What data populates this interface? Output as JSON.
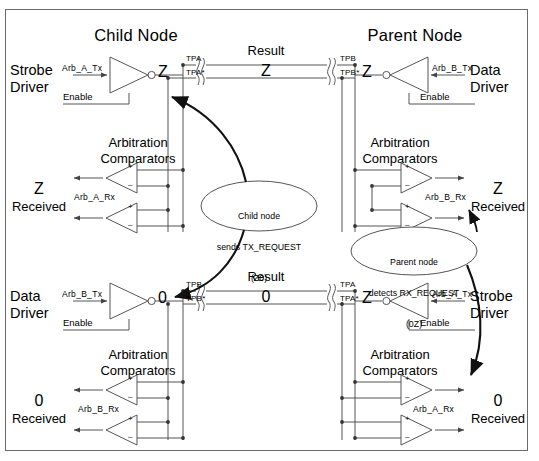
{
  "diagram": {
    "title_child": "Child Node",
    "title_parent": "Parent Node",
    "labels": {
      "strobe_driver_1": "Strobe",
      "strobe_driver_2": "Driver",
      "data_driver_1": "Data",
      "data_driver_2": "Driver",
      "arbitration_1": "Arbitration",
      "arbitration_2": "Comparators",
      "enable": "Enable",
      "result": "Result",
      "received": "Received"
    },
    "signals": {
      "arb_a_tx": "Arb_A_Tx",
      "arb_b_tx": "Arb_B_Tx",
      "arb_a_rx": "Arb_A_Rx",
      "arb_b_rx": "Arb_B_Rx"
    },
    "bus_labels": {
      "tpa": "TPA",
      "tpa_star": "TPA*",
      "tpb": "TPB",
      "tpb_star": "TPB*"
    },
    "top_bus": {
      "left_pair_top": "TPA",
      "left_pair_bottom": "TPA*",
      "right_pair_top": "TPB",
      "right_pair_bottom": "TPB*",
      "result_label": "Result",
      "result_value": "Z"
    },
    "bottom_bus": {
      "left_pair_top": "TPB",
      "left_pair_bottom": "TPB*",
      "right_pair_top": "TPA",
      "right_pair_bottom": "TPA*",
      "result_label": "Result",
      "result_value": "0"
    },
    "levels": {
      "child_strobe_out": "Z",
      "parent_data_out": "Z",
      "child_data_out": "0",
      "parent_strobe_out": "Z",
      "child_top_received": "Z",
      "parent_top_received": "Z",
      "child_bottom_received": "0",
      "parent_bottom_received": "0"
    },
    "callouts": [
      {
        "line1": "Child node",
        "line2": "sends TX_REQUEST",
        "line3": "(Z0)"
      },
      {
        "line1": "Parent node",
        "line2": "detects RX_REQUEST",
        "line3": "(0Z)"
      }
    ],
    "comparator_marks": {
      "plus": "+",
      "minus": "–"
    },
    "colors": {
      "ink": "#000000",
      "wire": "#555555",
      "frame": "#6b6b6b",
      "background": "#ffffff"
    }
  }
}
